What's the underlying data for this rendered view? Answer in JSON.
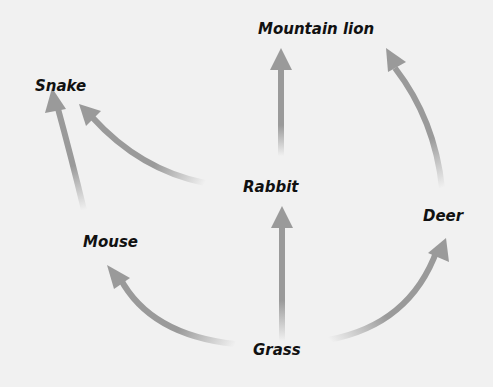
{
  "diagram": {
    "type": "food-web",
    "colors": {
      "background": "#f1f1f1",
      "arrow": "#9a9a9a",
      "text": "#111111"
    },
    "nodes": [
      {
        "id": "mountain_lion",
        "label": "Mountain lion"
      },
      {
        "id": "snake",
        "label": "Snake"
      },
      {
        "id": "rabbit",
        "label": "Rabbit"
      },
      {
        "id": "mouse",
        "label": "Mouse"
      },
      {
        "id": "deer",
        "label": "Deer"
      },
      {
        "id": "grass",
        "label": "Grass"
      }
    ],
    "edges": [
      {
        "from": "Grass",
        "to": "Mouse"
      },
      {
        "from": "Grass",
        "to": "Rabbit"
      },
      {
        "from": "Grass",
        "to": "Deer"
      },
      {
        "from": "Mouse",
        "to": "Snake"
      },
      {
        "from": "Rabbit",
        "to": "Snake"
      },
      {
        "from": "Rabbit",
        "to": "Mountain lion"
      },
      {
        "from": "Deer",
        "to": "Mountain lion"
      }
    ]
  }
}
